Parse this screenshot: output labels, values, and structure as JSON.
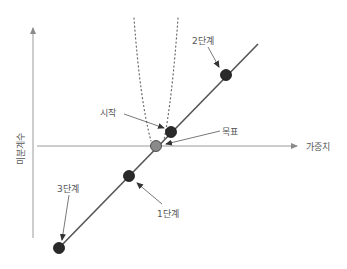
{
  "diagram": {
    "type": "gradient-descent-overshoot",
    "axes": {
      "x_label": "가중치",
      "y_label": "미분계수"
    },
    "points": [
      {
        "id": "start",
        "label": "시작",
        "x": 171,
        "y": 132,
        "fill": "#2a2a2a"
      },
      {
        "id": "goal",
        "label": "목표",
        "x": 156,
        "y": 146,
        "fill": "#8a8a8a"
      },
      {
        "id": "step1",
        "label": "1단계",
        "x": 129,
        "y": 176,
        "fill": "#2a2a2a"
      },
      {
        "id": "step2",
        "label": "2단계",
        "x": 226,
        "y": 75,
        "fill": "#2a2a2a"
      },
      {
        "id": "step3",
        "label": "3단계",
        "x": 59,
        "y": 248,
        "fill": "#2a2a2a"
      }
    ],
    "colors": {
      "axis": "#9a9a9a",
      "line": "#555555",
      "dots": "#777777",
      "point_dark": "#2a2a2a",
      "point_goal": "#8a8a8a"
    }
  }
}
